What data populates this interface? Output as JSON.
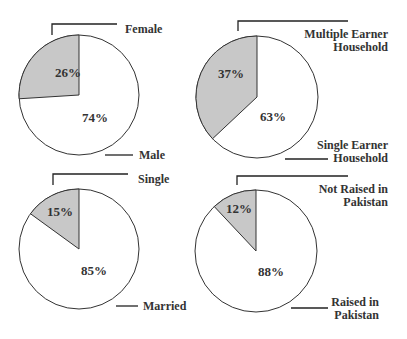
{
  "chart_data": [
    {
      "type": "pie",
      "title": "",
      "categories": [
        "Female",
        "Male"
      ],
      "values": [
        26,
        74
      ],
      "value_labels": [
        "26%",
        "74%"
      ],
      "colors": [
        "#c8c8c8",
        "#ffffff"
      ]
    },
    {
      "type": "pie",
      "title": "",
      "categories": [
        "Multiple Earner Household",
        "Single Earner Household"
      ],
      "values": [
        37,
        63
      ],
      "value_labels": [
        "37%",
        "63%"
      ],
      "colors": [
        "#c8c8c8",
        "#ffffff"
      ]
    },
    {
      "type": "pie",
      "title": "",
      "categories": [
        "Single",
        "Married"
      ],
      "values": [
        15,
        85
      ],
      "value_labels": [
        "15%",
        "85%"
      ],
      "colors": [
        "#c8c8c8",
        "#ffffff"
      ]
    },
    {
      "type": "pie",
      "title": "",
      "categories": [
        "Not Raised in Pakistan",
        "Raised in Pakistan"
      ],
      "values": [
        12,
        88
      ],
      "value_labels": [
        "12%",
        "88%"
      ],
      "colors": [
        "#c8c8c8",
        "#ffffff"
      ]
    }
  ],
  "labels": {
    "p1": {
      "a": [
        "Female"
      ],
      "b": [
        "Male"
      ]
    },
    "p2": {
      "a": [
        "Multiple Earner",
        "Household"
      ],
      "b": [
        "Single Earner",
        "Household"
      ]
    },
    "p3": {
      "a": [
        "Single"
      ],
      "b": [
        "Married"
      ]
    },
    "p4": {
      "a": [
        "Not Raised in",
        "Pakistan"
      ],
      "b": [
        "Raised in",
        "Pakistan"
      ]
    }
  }
}
